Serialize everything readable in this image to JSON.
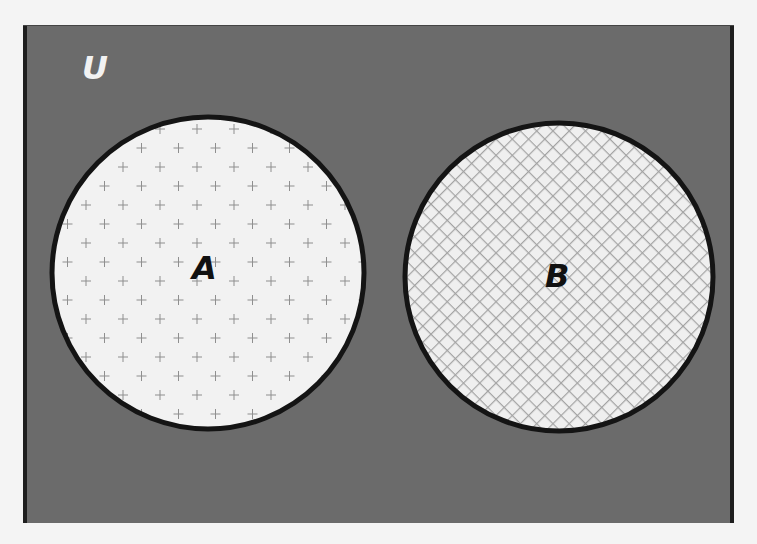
{
  "diagram": {
    "type": "venn",
    "universe": {
      "label": "U",
      "fill": "#6b6b6b",
      "edge_color": "#1a1a1a",
      "label_color": "#f2f2f2"
    },
    "sets": [
      {
        "label": "A",
        "pattern": "plus-dots",
        "fill": "#f2f2f2",
        "pattern_color": "#8a8a8a",
        "stroke": "#141414"
      },
      {
        "label": "B",
        "pattern": "crosshatch",
        "fill": "#f0f0f0",
        "pattern_color": "#a0a0a0",
        "stroke": "#141414"
      }
    ],
    "relationship": "disjoint"
  }
}
